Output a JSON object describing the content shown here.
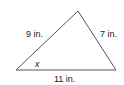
{
  "diagram": {
    "type": "triangle",
    "vertices": {
      "left": [
        16,
        70
      ],
      "apex": [
        78,
        11
      ],
      "right": [
        116,
        70
      ]
    },
    "sides": {
      "left": "9 in.",
      "right": "7 in.",
      "bottom": "11 in."
    },
    "angle_label": "x",
    "stroke_color": "#555555"
  }
}
